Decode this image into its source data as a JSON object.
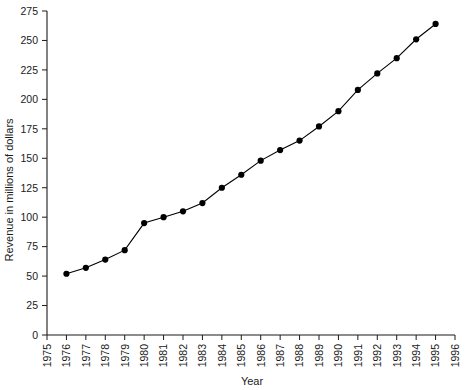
{
  "chart_data": {
    "type": "line",
    "title": "",
    "xlabel": "Year",
    "ylabel": "Revenue in millions of dollars",
    "x": [
      1976,
      1977,
      1978,
      1979,
      1980,
      1981,
      1982,
      1983,
      1984,
      1985,
      1986,
      1987,
      1988,
      1989,
      1990,
      1991,
      1992,
      1993,
      1994,
      1995
    ],
    "values": [
      52,
      57,
      64,
      72,
      95,
      100,
      105,
      112,
      125,
      136,
      148,
      157,
      165,
      177,
      190,
      208,
      222,
      235,
      251,
      264
    ],
    "series": [
      {
        "name": "Revenue",
        "values": [
          52,
          57,
          64,
          72,
          95,
          100,
          105,
          112,
          125,
          136,
          148,
          157,
          165,
          177,
          190,
          208,
          222,
          235,
          251,
          264
        ]
      }
    ],
    "xlim": [
      1975,
      1996
    ],
    "ylim": [
      0,
      275
    ],
    "xticks": [
      1975,
      1976,
      1977,
      1978,
      1979,
      1980,
      1981,
      1982,
      1983,
      1984,
      1985,
      1986,
      1987,
      1988,
      1989,
      1990,
      1991,
      1992,
      1993,
      1994,
      1995,
      1996
    ],
    "yticks": [
      0,
      25,
      50,
      75,
      100,
      125,
      150,
      175,
      200,
      225,
      250,
      275
    ],
    "xticklabels": [
      "1975",
      "1976",
      "1977",
      "1978",
      "1979",
      "1980",
      "1981",
      "1982",
      "1983",
      "1984",
      "1985",
      "1986",
      "1987",
      "1988",
      "1989",
      "1990",
      "1991",
      "1992",
      "1993",
      "1994",
      "1995",
      "1996"
    ],
    "yticklabels": [
      "0",
      "25",
      "50",
      "75",
      "100",
      "125",
      "150",
      "175",
      "200",
      "225",
      "250",
      "275"
    ],
    "grid": false,
    "legend": "none",
    "marker": "filled-circle",
    "line_color": "#000000",
    "marker_color": "#000000",
    "background_color": "#ffffff"
  }
}
